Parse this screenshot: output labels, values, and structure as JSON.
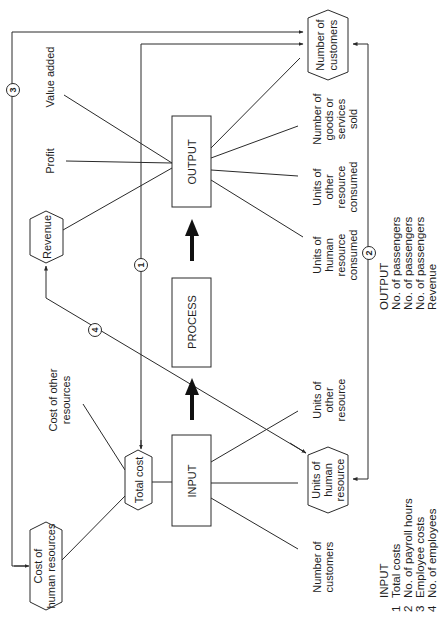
{
  "diagram": {
    "orientation": "rotated-90-ccw",
    "stages": {
      "input": "INPUT",
      "process": "PROCESS",
      "output": "OUTPUT"
    },
    "nodes": {
      "number_of_customers_out": [
        "Number of",
        "customers"
      ],
      "revenue": [
        "Revenue"
      ],
      "total_cost": [
        "Total cost"
      ],
      "cost_of_human_resources": [
        "Cost of",
        "human resources"
      ],
      "units_of_human_resource": [
        "Units of",
        "human",
        "resource"
      ]
    },
    "output_labels": {
      "value_added": [
        "Value added"
      ],
      "profit": [
        "Profit"
      ],
      "goods_sold": [
        "Number of",
        "goods or",
        "services",
        "sold"
      ],
      "other_consumed": [
        "Units of",
        "other",
        "resource",
        "consumed"
      ],
      "human_consumed": [
        "Units of",
        "human",
        "resource",
        "consumed"
      ]
    },
    "input_labels": {
      "cost_other": [
        "Cost of other",
        "resources"
      ],
      "units_other": [
        "Units of",
        "other",
        "resource"
      ],
      "customers_in": [
        "Number of",
        "customers"
      ]
    },
    "ratio_markers": [
      "1",
      "2",
      "3",
      "4"
    ]
  },
  "legend": {
    "input": {
      "title": "INPUT",
      "items": [
        {
          "num": "1",
          "label": "Total costs"
        },
        {
          "num": "2",
          "label": "No. of payroll hours"
        },
        {
          "num": "3",
          "label": "Employee costs"
        },
        {
          "num": "4",
          "label": "No. of employees"
        }
      ]
    },
    "output": {
      "title": "OUTPUT",
      "items": [
        "No. of passengers",
        "No. of passengers",
        "No. of passengers",
        "Revenue"
      ]
    }
  },
  "colors": {
    "line": "#2a2a2a",
    "text": "#1e1e1e",
    "background": "#ffffff"
  }
}
